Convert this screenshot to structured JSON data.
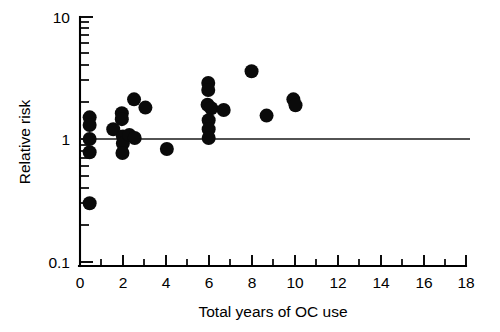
{
  "chart_data": {
    "type": "scatter",
    "title": "",
    "xlabel": "Total years of OC use",
    "ylabel": "Relative risk",
    "xlim": [
      0,
      18
    ],
    "ylim": [
      0.1,
      10
    ],
    "yscale": "log",
    "xscale": "linear",
    "grid": false,
    "legend": null,
    "x_ticks_major": [
      0,
      2,
      4,
      6,
      8,
      10,
      12,
      14,
      16,
      18
    ],
    "x_tick_labels": [
      "0",
      "2",
      "4",
      "6",
      "8",
      "10",
      "12",
      "14",
      "16",
      "18"
    ],
    "x_ticks_minor": [
      1,
      3,
      5,
      7,
      9,
      11,
      13,
      15,
      17
    ],
    "y_ticks_major": [
      0.1,
      1,
      10
    ],
    "y_tick_labels": [
      "0.1",
      "1",
      "10"
    ],
    "y_ticks_minor": [
      0.2,
      0.3,
      0.4,
      0.5,
      0.6,
      0.7,
      0.8,
      0.9,
      2,
      3,
      4,
      5,
      6,
      7,
      8,
      9
    ],
    "reference_lines": [
      {
        "axis": "y",
        "value": 1.0,
        "label": "null-effect-line"
      }
    ],
    "marker": {
      "shape": "circle",
      "color": "#0a0a0a",
      "size": 7.0
    },
    "points": [
      {
        "x": 0.45,
        "y": 1.5
      },
      {
        "x": 0.45,
        "y": 1.3
      },
      {
        "x": 0.45,
        "y": 1.0
      },
      {
        "x": 0.45,
        "y": 0.78
      },
      {
        "x": 0.45,
        "y": 0.3
      },
      {
        "x": 1.55,
        "y": 1.2
      },
      {
        "x": 1.95,
        "y": 1.62
      },
      {
        "x": 1.95,
        "y": 1.45
      },
      {
        "x": 2.0,
        "y": 1.05
      },
      {
        "x": 2.0,
        "y": 0.92
      },
      {
        "x": 1.98,
        "y": 0.77
      },
      {
        "x": 2.3,
        "y": 1.08
      },
      {
        "x": 2.52,
        "y": 2.1
      },
      {
        "x": 2.55,
        "y": 1.02
      },
      {
        "x": 3.05,
        "y": 1.8
      },
      {
        "x": 4.05,
        "y": 0.83
      },
      {
        "x": 5.98,
        "y": 2.85
      },
      {
        "x": 5.98,
        "y": 2.5
      },
      {
        "x": 5.95,
        "y": 1.9
      },
      {
        "x": 6.12,
        "y": 1.78
      },
      {
        "x": 6.0,
        "y": 1.42
      },
      {
        "x": 6.0,
        "y": 1.2
      },
      {
        "x": 6.0,
        "y": 1.02
      },
      {
        "x": 6.7,
        "y": 1.72
      },
      {
        "x": 8.0,
        "y": 3.55
      },
      {
        "x": 8.7,
        "y": 1.55
      },
      {
        "x": 9.95,
        "y": 2.1
      },
      {
        "x": 10.05,
        "y": 1.88
      }
    ]
  }
}
